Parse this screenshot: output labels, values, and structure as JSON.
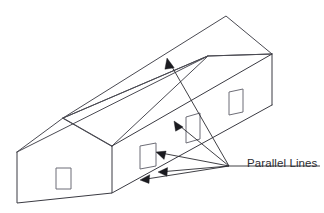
{
  "figure": {
    "annotation_label": "Parallel Lines",
    "stroke_color": "#4a4a52",
    "arrow_color": "#1b1b20",
    "window_stroke_color": "#6d6d76",
    "background_color": "#ffffff",
    "label_font_size_px": 11.5,
    "label_position": {
      "x": 247,
      "y": 164
    },
    "vanishing_point": {
      "x": 229,
      "y": 166
    },
    "leader_start": {
      "x": 320,
      "y": 166
    },
    "building": {
      "name": "house",
      "gable_end": {
        "name": "near-gable-wall",
        "points": "17,152 63,118 112,146 112,193 17,203"
      },
      "gable_roof_left_slope": {
        "name": "gable-roof-left-slope",
        "points": "17,152 63,118 131,82 82,114"
      },
      "ridge_line": {
        "x1": 63,
        "y1": 118,
        "x2": 226,
        "y2": 16
      },
      "eave_line_front": {
        "x1": 17,
        "y1": 152,
        "x2": 208,
        "y2": 56
      },
      "roof_far_edge": {
        "x1": 226,
        "y1": 16,
        "x2": 272,
        "y2": 54
      },
      "roof_near_edge": {
        "x1": 208,
        "y1": 56,
        "x2": 272,
        "y2": 54
      },
      "wall_top_line": {
        "x1": 112,
        "y1": 146,
        "x2": 272,
        "y2": 54
      },
      "wall_bottom_line": {
        "x1": 112,
        "y1": 193,
        "x2": 272,
        "y2": 105
      },
      "far_right_corner": {
        "x1": 272,
        "y1": 54,
        "x2": 272,
        "y2": 105
      },
      "gable_left_corner": {
        "x1": 17,
        "y1": 152,
        "x2": 17,
        "y2": 203
      },
      "gable_right_corner": {
        "x1": 112,
        "y1": 146,
        "x2": 112,
        "y2": 193
      },
      "gable_base": {
        "x1": 17,
        "y1": 203,
        "x2": 112,
        "y2": 193
      },
      "windows": [
        {
          "name": "gable-window",
          "points": "56,168 71,168 71,189 56,189"
        },
        {
          "name": "side-window-near",
          "points": "140,146 156,143 156,166 140,169"
        },
        {
          "name": "side-window-middle",
          "points": "186,117 200,113 200,139 186,143"
        },
        {
          "name": "side-window-far",
          "points": "229,92 243,89 243,112 229,115"
        }
      ]
    },
    "arrows": [
      {
        "name": "arrow-to-ridge",
        "from": {
          "x": 229,
          "y": 166
        },
        "to": {
          "x": 167,
          "y": 58
        },
        "target": "roof ridge / upper roof edge"
      },
      {
        "name": "arrow-to-eave",
        "from": {
          "x": 229,
          "y": 166
        },
        "to": {
          "x": 174,
          "y": 121
        },
        "target": "eave line"
      },
      {
        "name": "arrow-to-wall-top",
        "from": {
          "x": 229,
          "y": 166
        },
        "to": {
          "x": 156,
          "y": 152
        },
        "target": "wall top line"
      },
      {
        "name": "arrow-to-wall-bottom",
        "from": {
          "x": 229,
          "y": 166
        },
        "to": {
          "x": 158,
          "y": 172
        },
        "target": "window lower edge"
      },
      {
        "name": "arrow-to-base",
        "from": {
          "x": 229,
          "y": 166
        },
        "to": {
          "x": 140,
          "y": 180
        },
        "target": "wall base line"
      }
    ]
  }
}
